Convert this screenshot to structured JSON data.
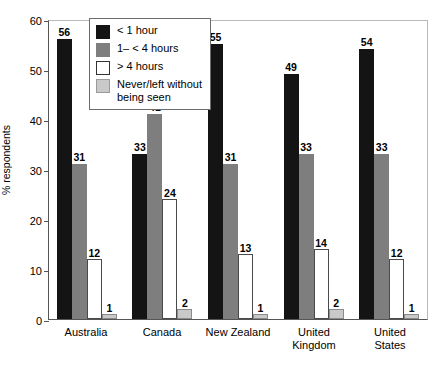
{
  "chart_data": {
    "type": "bar",
    "title": "",
    "xlabel": "",
    "ylabel": "% respondents",
    "ylim": [
      0,
      60
    ],
    "yticks": [
      0,
      10,
      20,
      30,
      40,
      50,
      60
    ],
    "grid": false,
    "legend_position": "top-left-inside",
    "categories": [
      "Australia",
      "Canada",
      "New Zealand",
      "United Kingdom",
      "United States"
    ],
    "series": [
      {
        "name": "< 1 hour",
        "color": "#141414",
        "values": [
          56,
          33,
          55,
          49,
          54
        ]
      },
      {
        "name": "1– < 4 hours",
        "color": "#7e7e7e",
        "values": [
          31,
          41,
          31,
          33,
          33
        ]
      },
      {
        "name": "> 4 hours",
        "color": "#ffffff",
        "values": [
          12,
          24,
          13,
          14,
          12
        ]
      },
      {
        "name": "Never/left without being seen",
        "color": "#c9c9c9",
        "values": [
          1,
          2,
          1,
          2,
          1
        ]
      }
    ]
  },
  "axis": {
    "y_title": "% respondents",
    "y_ticks": [
      "60",
      "50",
      "40",
      "30",
      "20",
      "10",
      "0"
    ],
    "x_labels": [
      "Australia",
      "Canada",
      "New Zealand",
      "United\nKingdom",
      "United\nStates"
    ]
  },
  "legend": {
    "items": [
      {
        "label": "< 1 hour"
      },
      {
        "label": "1– < 4 hours"
      },
      {
        "label": "> 4 hours"
      },
      {
        "label": "Never/left without\nbeing seen"
      }
    ]
  }
}
